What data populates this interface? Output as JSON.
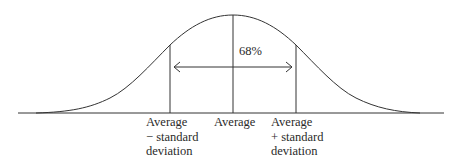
{
  "diagram": {
    "type": "normal-distribution",
    "center_label": "68%",
    "x_labels": {
      "minus_sd": [
        "Average",
        "− standard",
        "deviation"
      ],
      "mean": [
        "Average"
      ],
      "plus_sd": [
        "Average",
        "+ standard",
        "deviation"
      ]
    },
    "colors": {
      "stroke": "#333333",
      "text": "#2a2a2a",
      "background": "#ffffff"
    }
  }
}
